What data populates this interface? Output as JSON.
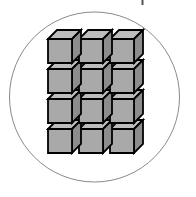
{
  "figure": {
    "canvas": {
      "width": 196,
      "height": 197,
      "background": "#ffffff"
    },
    "circle": {
      "name": "enclosing-circle",
      "cx": 94.5,
      "cy": 97.0,
      "r": 85.0,
      "stroke": "#8a8a8a",
      "stroke_width": 1,
      "fill": "none"
    },
    "top_mark": {
      "name": "top-tick-mark",
      "x": 141.5,
      "y": 0,
      "width": 2,
      "height": 5,
      "color": "#555555"
    },
    "cube_grid": {
      "name": "cube-grid",
      "columns": 3,
      "rows": 4,
      "total_cubes": 12,
      "origin_x": 48,
      "origin_y": 39,
      "col_pitch": 31,
      "row_pitch": 30,
      "face_size": 24,
      "depth_x": 9,
      "depth_y": 9,
      "colors": {
        "front": "#a9a9a9",
        "top": "#bdbdbd",
        "side": "#8d8d8d",
        "outline": "#000000"
      },
      "outline_width": 1.8,
      "row_labels": [
        "row-1",
        "row-2",
        "row-3",
        "row-4"
      ],
      "column_labels": [
        "col-1",
        "col-2",
        "col-3"
      ]
    }
  }
}
